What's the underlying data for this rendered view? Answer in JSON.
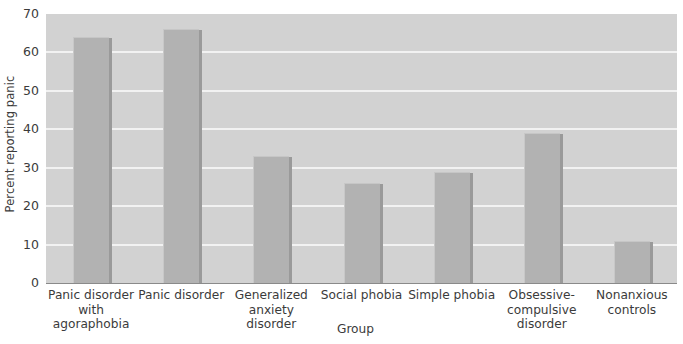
{
  "chart_data": {
    "type": "bar",
    "title": "",
    "xlabel": "Group",
    "ylabel": "Percent reporting panic",
    "ylim": [
      0,
      70
    ],
    "yticks": [
      0,
      10,
      20,
      30,
      40,
      50,
      60,
      70
    ],
    "grid": true,
    "legend": false,
    "categories": [
      "Panic disorder\nwith agoraphobia",
      "Panic disorder",
      "Generalized\nanxiety\ndisorder",
      "Social phobia",
      "Simple phobia",
      "Obsessive-\ncompulsive\ndisorder",
      "Nonanxious\ncontrols"
    ],
    "values": [
      64,
      66,
      33,
      26,
      29,
      39,
      11
    ],
    "bar_color": "#b2b2b2",
    "plot_background": "#d2d2d2",
    "gridline_color": "#f2f2f2",
    "text_color": "#3b3b3b"
  }
}
